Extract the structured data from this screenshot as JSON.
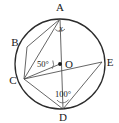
{
  "figure": {
    "type": "circle-geometry-diagram",
    "colors": {
      "circle_stroke": "#2b2b2b",
      "chord_stroke": "#4a4a4a",
      "label_text": "#1a1a1a",
      "background": "#ffffff"
    },
    "circle": {
      "center_label": "O",
      "center_x": 60,
      "center_y": 64,
      "radius": 45
    },
    "points": [
      {
        "label": "A",
        "x": 60,
        "y": 19,
        "label_x": 60,
        "label_y": 11,
        "position": "top"
      },
      {
        "label": "B",
        "x": 27,
        "y": 47,
        "label_x": 15,
        "label_y": 46,
        "position": "upper-left"
      },
      {
        "label": "C",
        "x": 24,
        "y": 79,
        "label_x": 13,
        "label_y": 84,
        "position": "lower-left"
      },
      {
        "label": "D",
        "x": 63,
        "y": 109,
        "label_x": 63,
        "label_y": 121,
        "position": "bottom"
      },
      {
        "label": "E",
        "x": 102,
        "y": 62,
        "label_x": 110,
        "label_y": 65,
        "position": "right"
      }
    ],
    "chords": [
      {
        "name": "chord-A-B",
        "from": "A",
        "to": "B"
      },
      {
        "name": "chord-A-C",
        "from": "A",
        "to": "C"
      },
      {
        "name": "chord-A-D",
        "from": "A",
        "to": "D"
      },
      {
        "name": "chord-B-C",
        "from": "B",
        "to": "C"
      },
      {
        "name": "chord-C-D",
        "from": "C",
        "to": "D"
      },
      {
        "name": "chord-C-E",
        "from": "C",
        "to": "E"
      },
      {
        "name": "chord-D-E",
        "from": "D",
        "to": "E"
      }
    ],
    "radii": [
      {
        "name": "radius-O-C",
        "from": "O",
        "to": "C"
      }
    ],
    "angles": [
      {
        "name": "angle-at-A",
        "vertex": "A",
        "value": "x",
        "label_x": 61,
        "label_y": 31,
        "italic": true
      },
      {
        "name": "angle-at-C",
        "vertex": "C",
        "value": "50°",
        "label_x": 43,
        "label_y": 66,
        "italic": false
      },
      {
        "name": "angle-at-D",
        "vertex": "D",
        "value": "100°",
        "label_x": 63,
        "label_y": 97,
        "italic": false
      }
    ]
  }
}
